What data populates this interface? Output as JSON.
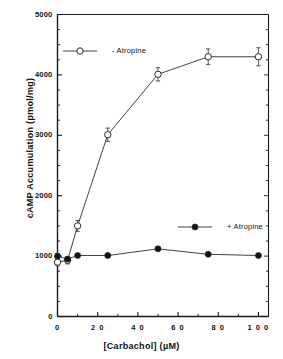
{
  "chart_data": {
    "type": "line",
    "title": "",
    "xlabel": "[Carbachol]  (µM)",
    "ylabel": "cAMP  Accumulation  (pmol/mg)",
    "xlim": [
      0,
      105
    ],
    "ylim": [
      0,
      5000
    ],
    "x_ticks": [
      0,
      20,
      40,
      60,
      80,
      100
    ],
    "x_tick_labels": [
      "0",
      "2 0",
      "4 0",
      "6 0",
      "8 0",
      "1 0 0"
    ],
    "x_minor_step": 10,
    "y_ticks": [
      0,
      1000,
      2000,
      3000,
      4000,
      5000
    ],
    "y_tick_labels": [
      "0",
      "1000",
      "2000",
      "3000",
      "4000",
      "5000"
    ],
    "y_minor_step": 250,
    "grid": false,
    "legend_position": "inside",
    "series": [
      {
        "name": "- Atropine",
        "marker": "open-circle",
        "x": [
          0,
          5,
          10,
          25,
          50,
          75,
          100
        ],
        "values": [
          900,
          930,
          1500,
          3010,
          4010,
          4300,
          4300
        ],
        "errors": [
          60,
          60,
          90,
          110,
          110,
          130,
          150
        ]
      },
      {
        "name": "+ Atropine",
        "marker": "filled-circle",
        "x": [
          0,
          5,
          10,
          25,
          50,
          75,
          100
        ],
        "values": [
          1000,
          950,
          1010,
          1010,
          1120,
          1030,
          1010
        ],
        "errors": [
          40,
          30,
          30,
          30,
          30,
          30,
          30
        ]
      }
    ]
  },
  "legend": {
    "entries": [
      {
        "label": "- Atropine",
        "marker": "open-circle"
      },
      {
        "label": "+ Atropine",
        "marker": "filled-circle"
      }
    ]
  },
  "axes": {
    "x_title": "[Carbachol]  (µM)",
    "y_title": "cAMP  Accumulation  (pmol/mg)"
  },
  "colors": {
    "axis": "#1a1a1a",
    "line": "#2b2b2b",
    "marker_open_fill": "#ffffff",
    "marker_filled_fill": "#111111"
  }
}
